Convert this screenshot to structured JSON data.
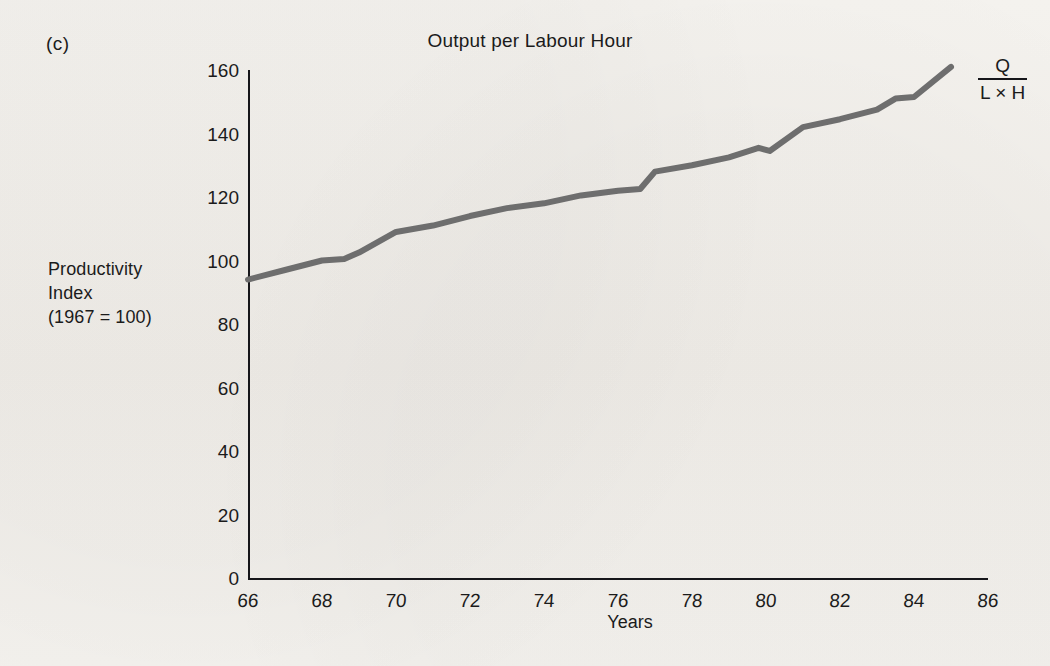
{
  "figure": {
    "panel_label": "(c)",
    "title": "Output per Labour Hour",
    "y_axis_title_line1": "Productivity",
    "y_axis_title_line2": "Index",
    "y_axis_title_line3": "(1967 = 100)",
    "x_axis_title": "Years",
    "formula": {
      "numerator": "Q",
      "denominator": "L × H"
    },
    "line_color": "#6e6e6e",
    "axis_color": "#16161a",
    "background_color": "#f2f0ec"
  },
  "chart_data": {
    "type": "line",
    "title": "Output per Labour Hour",
    "subtitle": "(c)",
    "xlabel": "Years",
    "ylabel": "Productivity Index (1967 = 100)",
    "xlim": [
      66,
      86
    ],
    "ylim": [
      0,
      160
    ],
    "xticks": [
      "66",
      "68",
      "70",
      "72",
      "74",
      "76",
      "78",
      "80",
      "82",
      "84",
      "86"
    ],
    "xtick_values": [
      66,
      68,
      70,
      72,
      74,
      76,
      78,
      80,
      82,
      84,
      86
    ],
    "yticks": [
      "0",
      "20",
      "40",
      "60",
      "80",
      "100",
      "120",
      "140",
      "160"
    ],
    "ytick_values": [
      0,
      20,
      40,
      60,
      80,
      100,
      120,
      140,
      160
    ],
    "grid": false,
    "legend": "none",
    "annotation": "Q / (L × H)",
    "series": [
      {
        "name": "Output per Labour Hour",
        "x": [
          66,
          67,
          68,
          68.6,
          69,
          70,
          71,
          72,
          73,
          74,
          75,
          76,
          76.6,
          77,
          78,
          79,
          79.8,
          80.1,
          81,
          82,
          83,
          83.5,
          84,
          85
        ],
        "values": [
          94,
          97,
          100,
          100.5,
          102.5,
          109,
          111,
          114,
          116.5,
          118,
          120.5,
          122,
          122.5,
          128,
          130,
          132.5,
          135.5,
          134.5,
          142,
          144.5,
          147.5,
          151,
          151.5,
          161
        ]
      }
    ]
  }
}
